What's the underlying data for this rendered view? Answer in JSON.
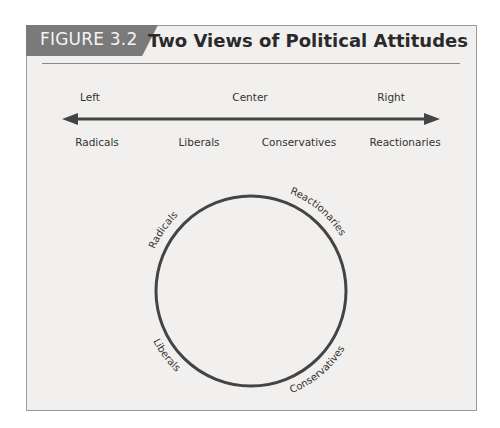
{
  "figure": {
    "tab_label": "FIGURE 3.2",
    "title": "Two Views of Political Attitudes",
    "colors": {
      "tab": "#7a7a7a",
      "panel": "#f1f0ef",
      "line": "#444444"
    }
  },
  "linear_view": {
    "top_labels": [
      "Left",
      "Center",
      "Right"
    ],
    "bottom_labels": [
      "Radicals",
      "Liberals",
      "Conservatives",
      "Reactionaries"
    ]
  },
  "circular_view": {
    "labels": [
      "Radicals",
      "Reactionaries",
      "Liberals",
      "Conservatives"
    ]
  }
}
